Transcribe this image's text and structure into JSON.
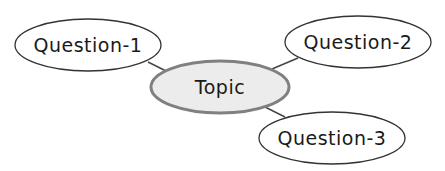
{
  "diagram": {
    "type": "mind-map",
    "center": {
      "label": "Topic",
      "fill": "#ececec",
      "stroke": "#808080"
    },
    "branches": [
      {
        "label": "Question-1"
      },
      {
        "label": "Question-2"
      },
      {
        "label": "Question-3"
      }
    ],
    "colors": {
      "branch_fill": "#ffffff",
      "branch_stroke": "#333333",
      "edge": "#444444",
      "text": "#1a1a1a"
    }
  }
}
